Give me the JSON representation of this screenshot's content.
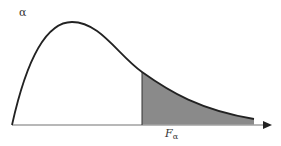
{
  "diagram": {
    "type": "F-distribution density with shaded upper tail",
    "labels": {
      "alpha": "α",
      "critical_value": "F",
      "critical_value_subscript": "α"
    },
    "colors": {
      "curve": "#222222",
      "shaded_region": "#8a8a8a",
      "axis": "#999999",
      "background": "#ffffff"
    }
  }
}
